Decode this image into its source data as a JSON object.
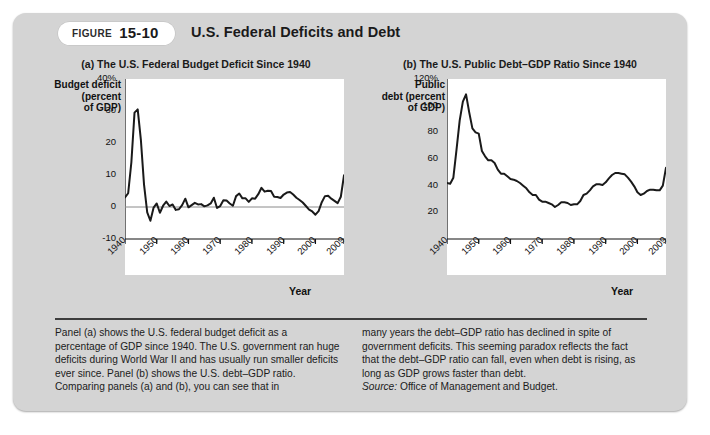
{
  "figure": {
    "badge_label": "FIGURE",
    "badge_number": "15-10",
    "title": "U.S. Federal Deficits and Debt"
  },
  "panel_a": {
    "title": "(a) The U.S. Federal Budget Deficit Since 1940",
    "ylabel": "Budget deficit\n(percent\nof GDP)",
    "ylabel_line1": "Budget deficit",
    "ylabel_line2": "(percent",
    "ylabel_line3": "of GDP)",
    "xaxis_label": "Year"
  },
  "panel_b": {
    "title": "(b) The U.S. Public Debt–GDP Ratio Since 1940",
    "ylabel_line1": "Public",
    "ylabel_line2": "debt (percent",
    "ylabel_line3": "of GDP)",
    "xaxis_label": "Year"
  },
  "caption": {
    "left": "Panel (a) shows the U.S. federal budget deficit as a percentage of GDP since 1940. The U.S. government ran huge deficits during World War II and has usually run smaller deficits ever since. Panel (b) shows the U.S. debt–GDP ratio. Comparing panels (a) and (b), you can see that in",
    "right": "many years the debt–GDP ratio has declined in spite of government deficits. This seeming paradox reflects the fact that the debt–GDP ratio can fall, even when debt is rising, as long as GDP grows faster than debt.",
    "source_label": "Source:",
    "source_text": "Office of Management and Budget."
  },
  "colors": {
    "frame": "#d4d4d4",
    "plot_bg": "#ffffff",
    "line": "#1a1a1a",
    "axis": "#111111",
    "rule": "#3d3d3d"
  },
  "chart_data": [
    {
      "type": "line",
      "title": "(a) The U.S. Federal Budget Deficit Since 1940",
      "xlabel": "Year",
      "ylabel": "Budget deficit (percent of GDP)",
      "xlim": [
        1940,
        2009
      ],
      "ylim": [
        -10,
        40
      ],
      "yticks": [
        -10,
        0,
        10,
        20,
        30,
        40
      ],
      "ytick_labels": [
        "-10",
        "0",
        "10",
        "20",
        "30",
        "40%"
      ],
      "xticks": [
        1940,
        1950,
        1960,
        1970,
        1980,
        1990,
        2000,
        2009
      ],
      "xtick_labels": [
        "1940",
        "1950",
        "1960",
        "1970",
        "1980",
        "1990",
        "2000",
        "2009"
      ],
      "grid": false,
      "legend": "none",
      "zero_line": true,
      "series": [
        {
          "name": "Budget deficit (percent of GDP)",
          "x": [
            1940,
            1941,
            1942,
            1943,
            1944,
            1945,
            1946,
            1947,
            1948,
            1949,
            1950,
            1951,
            1952,
            1953,
            1954,
            1955,
            1956,
            1957,
            1958,
            1959,
            1960,
            1961,
            1962,
            1963,
            1964,
            1965,
            1966,
            1967,
            1968,
            1969,
            1970,
            1971,
            1972,
            1973,
            1974,
            1975,
            1976,
            1977,
            1978,
            1979,
            1980,
            1981,
            1982,
            1983,
            1984,
            1985,
            1986,
            1987,
            1988,
            1989,
            1990,
            1991,
            1992,
            1993,
            1994,
            1995,
            1996,
            1997,
            1998,
            1999,
            2000,
            2001,
            2002,
            2003,
            2004,
            2005,
            2006,
            2007,
            2008,
            2009
          ],
          "values": [
            3.0,
            4.3,
            13.9,
            29.5,
            30.5,
            21.0,
            7.0,
            -1.7,
            -4.3,
            -0.2,
            1.1,
            -1.8,
            0.4,
            1.7,
            0.3,
            0.8,
            -0.9,
            -0.7,
            0.6,
            2.6,
            -0.1,
            0.6,
            1.3,
            0.8,
            0.9,
            0.2,
            0.5,
            1.1,
            2.9,
            -0.3,
            0.3,
            2.1,
            2.0,
            1.1,
            0.4,
            3.4,
            4.2,
            2.7,
            2.7,
            1.6,
            2.7,
            2.6,
            4.0,
            6.0,
            4.8,
            5.1,
            5.0,
            3.2,
            3.1,
            2.8,
            3.9,
            4.5,
            4.7,
            3.9,
            2.9,
            2.2,
            1.4,
            0.3,
            -0.8,
            -1.4,
            -2.4,
            -1.3,
            1.5,
            3.4,
            3.5,
            2.6,
            1.9,
            1.2,
            3.2,
            9.9
          ]
        }
      ]
    },
    {
      "type": "line",
      "title": "(b) The U.S. Public Debt–GDP Ratio Since 1940",
      "xlabel": "Year",
      "ylabel": "Public debt (percent of GDP)",
      "xlim": [
        1940,
        2009
      ],
      "ylim": [
        0,
        120
      ],
      "yticks": [
        20,
        40,
        60,
        80,
        100,
        120
      ],
      "ytick_labels": [
        "20",
        "40",
        "60",
        "80",
        "100",
        "120%"
      ],
      "xticks": [
        1940,
        1950,
        1960,
        1970,
        1980,
        1990,
        2000,
        2009
      ],
      "xtick_labels": [
        "1940",
        "1950",
        "1960",
        "1970",
        "1980",
        "1990",
        "2000",
        "2009"
      ],
      "grid": false,
      "legend": "none",
      "zero_line": false,
      "series": [
        {
          "name": "Public debt (percent of GDP)",
          "x": [
            1940,
            1941,
            1942,
            1943,
            1944,
            1945,
            1946,
            1947,
            1948,
            1949,
            1950,
            1951,
            1952,
            1953,
            1954,
            1955,
            1956,
            1957,
            1958,
            1959,
            1960,
            1961,
            1962,
            1963,
            1964,
            1965,
            1966,
            1967,
            1968,
            1969,
            1970,
            1971,
            1972,
            1973,
            1974,
            1975,
            1976,
            1977,
            1978,
            1979,
            1980,
            1981,
            1982,
            1983,
            1984,
            1985,
            1986,
            1987,
            1988,
            1989,
            1990,
            1991,
            1992,
            1993,
            1994,
            1995,
            1996,
            1997,
            1998,
            1999,
            2000,
            2001,
            2002,
            2003,
            2004,
            2005,
            2006,
            2007,
            2008,
            2009
          ],
          "values": [
            42.0,
            41.5,
            46.0,
            67.0,
            89.0,
            103.0,
            108.5,
            95.0,
            83.0,
            80.0,
            79.0,
            66.0,
            62.0,
            59.0,
            59.0,
            57.0,
            52.0,
            49.0,
            49.0,
            47.0,
            45.0,
            44.5,
            43.5,
            42.0,
            40.0,
            38.0,
            35.0,
            33.0,
            33.0,
            29.5,
            28.0,
            28.0,
            27.0,
            26.0,
            24.0,
            25.5,
            27.5,
            27.5,
            27.0,
            25.5,
            26.0,
            26.0,
            28.5,
            33.0,
            34.0,
            36.5,
            39.5,
            41.0,
            41.0,
            40.5,
            42.5,
            45.5,
            48.0,
            49.5,
            49.5,
            49.0,
            48.5,
            46.0,
            43.0,
            39.5,
            35.0,
            33.0,
            34.0,
            36.0,
            37.0,
            37.0,
            36.5,
            36.5,
            40.0,
            53.5
          ]
        }
      ]
    }
  ]
}
